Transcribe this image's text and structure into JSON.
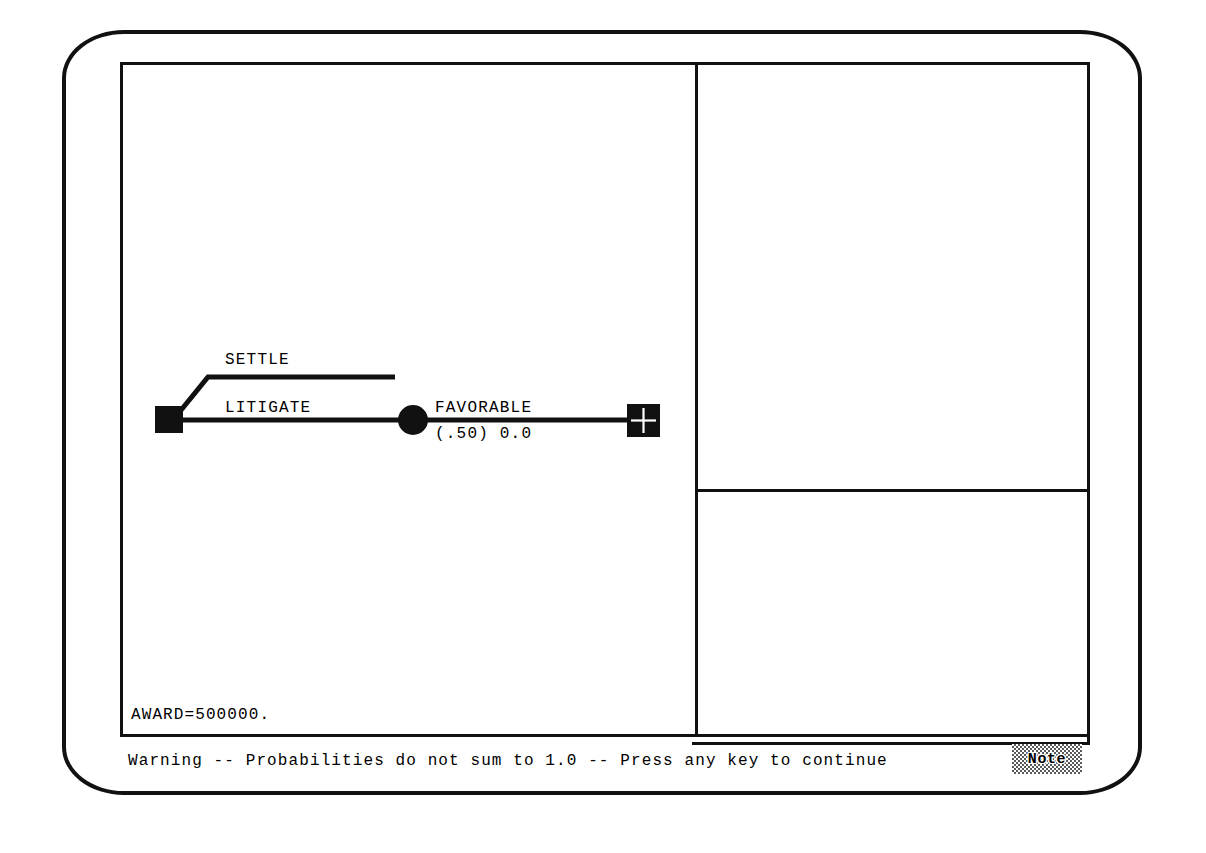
{
  "app": {
    "type": "decision-tree-editor",
    "display_style": "crt-monitor"
  },
  "colors": {
    "ink": "#111111",
    "background": "#ffffff",
    "dither": "#5a5a5a"
  },
  "tree": {
    "root_node": {
      "name": "decision-node",
      "shape": "filled-square"
    },
    "branches": [
      {
        "label": "SETTLE",
        "kind": "decision-branch",
        "endpoint": "open"
      },
      {
        "label": "LITIGATE",
        "kind": "decision-branch",
        "endpoint": "chance-node"
      }
    ],
    "chance_node": {
      "name": "chance-node",
      "shape": "filled-circle",
      "branches": [
        {
          "label": "FAVORABLE",
          "probability_text": "(.50) 0.0",
          "probability": 0.5,
          "payoff": 0.0,
          "endpoint": "terminal-node"
        }
      ]
    },
    "terminal_node": {
      "name": "terminal-node",
      "shape": "pinwheel-square"
    }
  },
  "readout": {
    "award_label": "AWARD=500000."
  },
  "status": {
    "message": "Warning -- Probabilities do not sum to 1.0 -- Press any key to continue",
    "note_button_label": "Note"
  },
  "panels": {
    "tree_pane_name": "tree-pane",
    "side_upper_name": "side-panel-upper",
    "side_lower_name": "side-panel-lower"
  }
}
